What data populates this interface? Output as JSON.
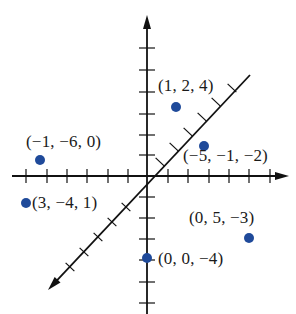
{
  "diagram": {
    "type": "3d-coordinate-plot",
    "axes": {
      "color": "#111111",
      "origin_px": [
        147,
        176
      ],
      "vertical": {
        "top": 15,
        "bottom": 314,
        "ticks": [
          48,
          70,
          92,
          114,
          135,
          155,
          197,
          218,
          239,
          260,
          282,
          303
        ]
      },
      "horizontal": {
        "left": 12,
        "right": 289,
        "ticks": [
          26,
          47,
          67,
          87,
          108,
          128,
          168,
          188,
          209,
          229,
          249,
          270
        ]
      },
      "diagonal": {
        "from": [
          48,
          290
        ],
        "to": [
          250,
          75
        ],
        "ticks": [
          [
            70,
            267
          ],
          [
            84,
            252
          ],
          [
            98,
            237
          ],
          [
            112,
            222
          ],
          [
            126,
            207
          ],
          [
            160,
            162
          ],
          [
            174,
            147
          ],
          [
            188,
            132
          ],
          [
            202,
            117
          ],
          [
            216,
            102
          ],
          [
            232,
            88
          ]
        ]
      }
    },
    "point_color": "#1f4a9a",
    "points": [
      {
        "label": "(1, 2, 4)",
        "px": [
          176,
          107
        ],
        "label_px": [
          158,
          77
        ]
      },
      {
        "label": "(−5, −1, −2)",
        "px": [
          204,
          146
        ],
        "label_px": [
          183,
          147
        ]
      },
      {
        "label": "(−1, −6, 0)",
        "px": [
          40,
          160
        ],
        "label_px": [
          26,
          133
        ]
      },
      {
        "label": "(3, −4, 1)",
        "px": [
          26,
          203
        ],
        "label_px": [
          32,
          194
        ]
      },
      {
        "label": "(0, 5, −3)",
        "px": [
          249,
          238
        ],
        "label_px": [
          189,
          209
        ]
      },
      {
        "label": "(0, 0, −4)",
        "px": [
          147,
          258
        ],
        "label_px": [
          158,
          250
        ]
      }
    ]
  }
}
